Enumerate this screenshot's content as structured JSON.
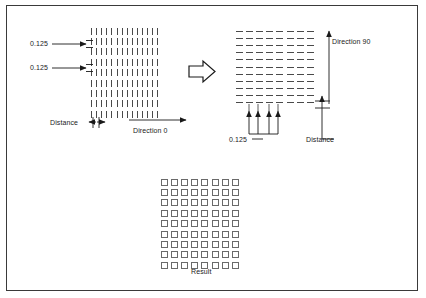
{
  "figure": {
    "background_color": "#ffffff",
    "border_color": "#3a3a3a",
    "ink_color": "#4a4a4a",
    "text_color": "#1a1a1a"
  },
  "left_panel": {
    "name": "Direction 0 hatch pattern",
    "spacing_label_top": "0.125",
    "spacing_label_bottom": "0.125",
    "distance_label": "Distance",
    "direction_label": "Direction 0",
    "grid": {
      "rows": 9,
      "cols": 14,
      "dash_orientation": "vertical"
    }
  },
  "transform_arrow": {
    "name": "rotate-arrow",
    "glyph": "right-block-arrow"
  },
  "right_panel": {
    "name": "Direction 90 hatch pattern",
    "spacing_label": "0.125",
    "distance_label": "Distance",
    "direction_label": "Direction 90",
    "grid": {
      "rows": 11,
      "cols": 8,
      "dash_orientation": "horizontal"
    }
  },
  "result_panel": {
    "name": "Combined crosshatch result",
    "caption": "Result",
    "grid": {
      "rows": 9,
      "cols": 8,
      "cell_shape": "square"
    }
  },
  "chart_data": {
    "type": "diagram",
    "elements": [
      {
        "id": "direction-0",
        "direction_degrees": 0,
        "spacing": 0.125,
        "label": "Direction 0"
      },
      {
        "id": "direction-90",
        "direction_degrees": 90,
        "spacing": 0.125,
        "label": "Direction 90"
      },
      {
        "id": "result",
        "label": "Result",
        "description": "grid of squares"
      }
    ]
  }
}
